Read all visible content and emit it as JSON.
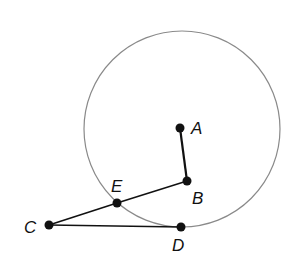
{
  "diagram": {
    "type": "circle-geometry",
    "circle": {
      "center_label": "A",
      "cx": 182,
      "cy": 129,
      "r": 98,
      "stroke": "#8a8a8a"
    },
    "points": [
      {
        "id": "A",
        "label": "A",
        "x": 180,
        "y": 128,
        "label_x": 191,
        "label_y": 134
      },
      {
        "id": "B",
        "label": "B",
        "x": 187,
        "y": 181,
        "label_x": 192,
        "label_y": 204
      },
      {
        "id": "E",
        "label": "E",
        "x": 117,
        "y": 203,
        "label_x": 111,
        "label_y": 192
      },
      {
        "id": "C",
        "label": "C",
        "x": 49,
        "y": 225,
        "label_x": 24,
        "label_y": 233
      },
      {
        "id": "D",
        "label": "D",
        "x": 181,
        "y": 227,
        "label_x": 172,
        "label_y": 251
      }
    ],
    "segments": [
      {
        "from": "A",
        "to": "B",
        "width": 2.2
      },
      {
        "from": "B",
        "to": "E",
        "width": 1.5
      },
      {
        "from": "E",
        "to": "C",
        "width": 1.5
      },
      {
        "from": "C",
        "to": "D",
        "width": 1.5
      }
    ],
    "colors": {
      "line": "#111111",
      "point": "#111111",
      "circle": "#8a8a8a"
    }
  }
}
